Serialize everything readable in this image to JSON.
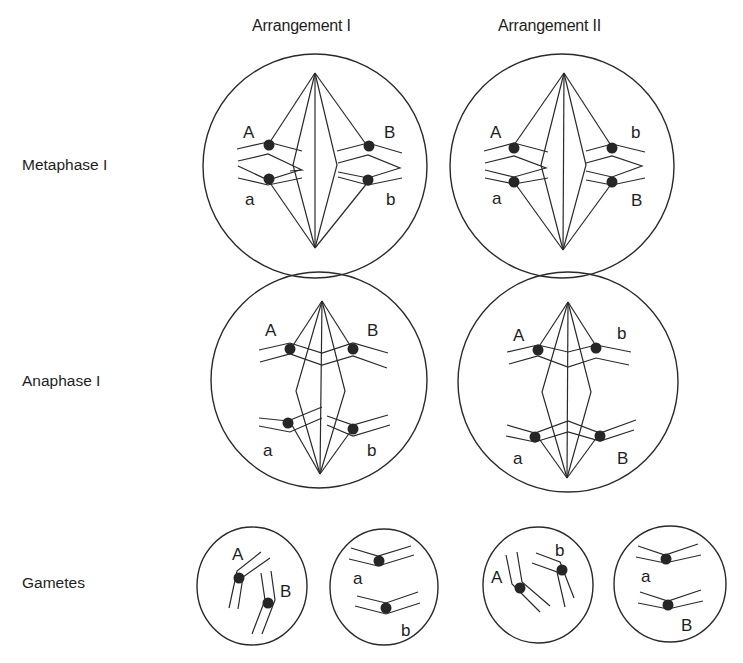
{
  "header": {
    "truncated_caption": "(b) ...",
    "columns": [
      "Arrangement I",
      "Arrangement II"
    ]
  },
  "rows": [
    "Metaphase I",
    "Anaphase I",
    "Gametes"
  ],
  "arrangements": [
    {
      "name": "Arrangement I",
      "metaphase": {
        "left_top": "A",
        "left_bottom": "a",
        "right_top": "B",
        "right_bottom": "b"
      },
      "anaphase": {
        "top_left": "A",
        "top_right": "B",
        "bottom_left": "a",
        "bottom_right": "b"
      },
      "gametes": [
        {
          "alleles": [
            "A",
            "B"
          ]
        },
        {
          "alleles": [
            "a",
            "b"
          ]
        }
      ]
    },
    {
      "name": "Arrangement II",
      "metaphase": {
        "left_top": "A",
        "left_bottom": "a",
        "right_top": "b",
        "right_bottom": "B"
      },
      "anaphase": {
        "top_left": "A",
        "top_right": "b",
        "bottom_left": "a",
        "bottom_right": "B"
      },
      "gametes": [
        {
          "alleles": [
            "A",
            "b"
          ]
        },
        {
          "alleles": [
            "a",
            "B"
          ]
        }
      ]
    }
  ]
}
